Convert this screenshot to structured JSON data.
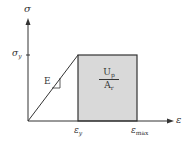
{
  "diagram": {
    "type": "stress-strain elastic-perfectly-plastic",
    "axes": {
      "y_label": "σ",
      "x_label": "ε"
    },
    "ticks": {
      "y_yield": {
        "symbol": "σ",
        "sub": "y"
      },
      "x_yield": {
        "symbol": "ε",
        "sub": "y"
      },
      "x_max": {
        "symbol": "ε",
        "sub": "max"
      }
    },
    "slope_label": "E",
    "area_label": {
      "numerator": {
        "symbol": "U",
        "sub": "p"
      },
      "denominator": {
        "symbol": "A",
        "sub": "r"
      }
    },
    "colors": {
      "line": "#333333",
      "shaded_area": "#d9d9d9"
    }
  }
}
